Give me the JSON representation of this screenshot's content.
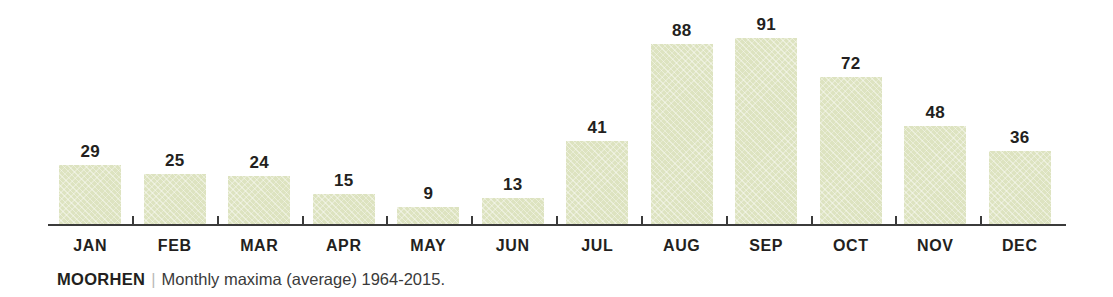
{
  "chart_data": {
    "type": "bar",
    "title": "",
    "subtitle": "",
    "xlabel": "",
    "ylabel": "",
    "ylim": [
      0,
      91
    ],
    "grid": false,
    "legend": "none",
    "categories": [
      "JAN",
      "FEB",
      "MAR",
      "APR",
      "MAY",
      "JUN",
      "JUL",
      "AUG",
      "SEP",
      "OCT",
      "NOV",
      "DEC"
    ],
    "values": [
      29,
      25,
      24,
      15,
      9,
      13,
      41,
      88,
      91,
      72,
      48,
      36
    ],
    "data_labels": [
      "29",
      "25",
      "24",
      "15",
      "9",
      "13",
      "41",
      "88",
      "91",
      "72",
      "48",
      "36"
    ],
    "bar_color": "#dde3c0",
    "axis_color": "#3b3b3b",
    "label_color": "#231f20",
    "background": "#ffffff"
  },
  "caption": {
    "name": "MOORHEN",
    "separator": "|",
    "text": "Monthly maxima (average) 1964-2015."
  }
}
